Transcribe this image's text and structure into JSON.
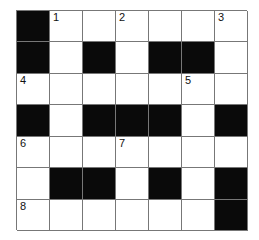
{
  "puzzle": {
    "rows": 7,
    "cols": 7,
    "colors": {
      "block": "#0a0a0a",
      "cell": "#ffffff",
      "line": "#777777"
    },
    "grid": [
      [
        "#",
        "1",
        "",
        "2",
        "",
        "",
        "3"
      ],
      [
        "#",
        "",
        "#",
        "",
        "#",
        "#",
        ""
      ],
      [
        "4",
        "",
        "",
        "",
        "",
        "5",
        ""
      ],
      [
        "#",
        "",
        "#",
        "#",
        "#",
        "",
        "#"
      ],
      [
        "6",
        "",
        "",
        "7",
        "",
        "",
        ""
      ],
      [
        "",
        "#",
        "#",
        "",
        "#",
        "",
        "#"
      ],
      [
        "8",
        "",
        "",
        "",
        "",
        "",
        "#"
      ]
    ],
    "clue_numbers": [
      "1",
      "2",
      "3",
      "4",
      "5",
      "6",
      "7",
      "8"
    ]
  }
}
